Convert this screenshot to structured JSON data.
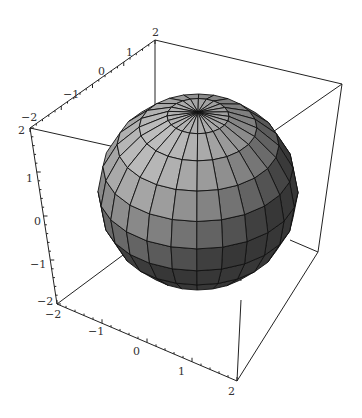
{
  "chart_data": {
    "type": "surface3d",
    "title": "",
    "surface": {
      "shape": "sphere",
      "radius": 2,
      "center": [
        0,
        0,
        0
      ],
      "latitude_bands": 10,
      "longitude_segments": 24
    },
    "axes": {
      "x": {
        "range": [
          -2,
          2
        ],
        "ticks": [
          -2,
          -1,
          0,
          1,
          2
        ]
      },
      "y": {
        "range": [
          -2,
          2
        ],
        "ticks": [
          -2,
          -1,
          0,
          1,
          2
        ]
      },
      "z": {
        "range": [
          -2,
          2
        ],
        "ticks": [
          -2,
          -1,
          0,
          1,
          2
        ]
      }
    },
    "xlabel": "",
    "ylabel": "",
    "zlabel": "",
    "boxed": true,
    "grid": false,
    "legend": null
  },
  "colors": {
    "background": "#ffffff",
    "box": "#222222",
    "mesh_lines": "#111111",
    "face_light": "#b8b8b8",
    "face_dark": "#3a3a3a"
  },
  "projection": {
    "vertices": {
      "top_back_left": [
        30,
        128
      ],
      "top_back_right": [
        155,
        40
      ],
      "top_front_right": [
        342,
        84
      ],
      "top_front_left": [
        218,
        170
      ],
      "bottom_back_left": [
        57,
        304
      ],
      "bottom_front_left": [
        237,
        381
      ],
      "bottom_front_right": [
        318,
        252
      ],
      "bottom_back_right": [
        180,
        210
      ]
    },
    "sphere_center": [
      198,
      192
    ],
    "sphere_radius": 100
  },
  "axis_labels": {
    "top_axis": [
      {
        "text": "-2",
        "x": 21,
        "y": 121
      },
      {
        "text": "-1",
        "x": 63,
        "y": 98
      },
      {
        "text": "0",
        "x": 98,
        "y": 75
      },
      {
        "text": "1",
        "x": 126,
        "y": 56
      },
      {
        "text": "2",
        "x": 152,
        "y": 36
      }
    ],
    "left_axis": [
      {
        "text": "2",
        "x": 18,
        "y": 134
      },
      {
        "text": "1",
        "x": 26,
        "y": 182
      },
      {
        "text": "0",
        "x": 34,
        "y": 225
      },
      {
        "text": "-1",
        "x": 30,
        "y": 268
      },
      {
        "text": "-2",
        "x": 37,
        "y": 305
      }
    ],
    "bottom_axis": [
      {
        "text": "-2",
        "x": 45,
        "y": 318
      },
      {
        "text": "-1",
        "x": 88,
        "y": 335
      },
      {
        "text": "0",
        "x": 133,
        "y": 355
      },
      {
        "text": "1",
        "x": 178,
        "y": 375
      },
      {
        "text": "2",
        "x": 228,
        "y": 395
      }
    ]
  }
}
